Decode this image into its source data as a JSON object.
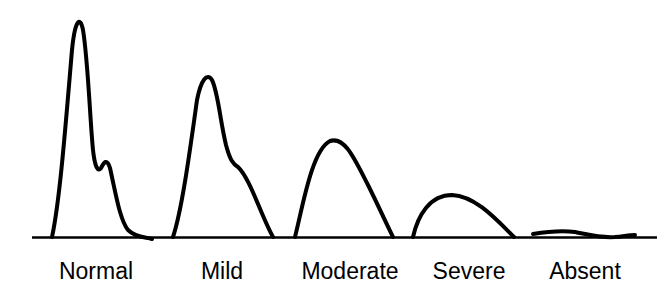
{
  "diagram": {
    "type": "waveform-grades",
    "stroke_color": "#000000",
    "background": "#ffffff",
    "labels": [
      {
        "id": "normal",
        "text": "Normal",
        "x": 96
      },
      {
        "id": "mild",
        "text": "Mild",
        "x": 222
      },
      {
        "id": "moderate",
        "text": "Moderate",
        "x": 350
      },
      {
        "id": "severe",
        "text": "Severe",
        "x": 469
      },
      {
        "id": "absent",
        "text": "Absent",
        "x": 585
      }
    ],
    "waveforms": [
      {
        "id": "normal",
        "relative_amplitude": 1.0,
        "features": "sharp peak with dicrotic notch/secondary bump"
      },
      {
        "id": "mild",
        "relative_amplitude": 0.75,
        "features": "rounded peak with shoulder"
      },
      {
        "id": "moderate",
        "relative_amplitude": 0.45,
        "features": "rounded, no notch"
      },
      {
        "id": "severe",
        "relative_amplitude": 0.2,
        "features": "low rounded"
      },
      {
        "id": "absent",
        "relative_amplitude": 0.02,
        "features": "nearly flat"
      }
    ]
  }
}
